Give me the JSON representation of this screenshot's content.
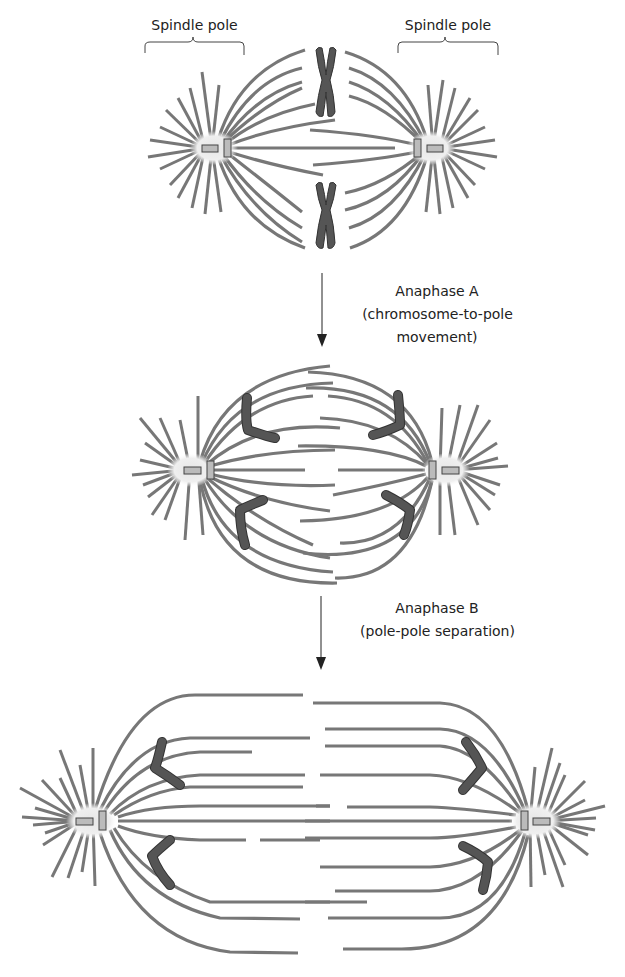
{
  "labels": {
    "spindle_pole_left": "Spindle pole",
    "spindle_pole_right": "Spindle pole",
    "anaphase_a_title": "Anaphase A",
    "anaphase_a_line1": "(chromosome-to-pole",
    "anaphase_a_line2": "movement)",
    "anaphase_b_title": "Anaphase B",
    "anaphase_b_line1": "(pole-pole separation)"
  },
  "stages": [
    {
      "name": "metaphase",
      "left_pole_x": 213,
      "right_pole_x": 432,
      "pole_y": 148
    },
    {
      "name": "anaphase-a",
      "left_pole_x": 190,
      "right_pole_x": 447,
      "pole_y": 470
    },
    {
      "name": "anaphase-b",
      "left_pole_x": 85,
      "right_pole_x": 537,
      "pole_y": 821
    }
  ],
  "colors": {
    "microtubule": "#777777",
    "chromosome": "#555555",
    "centrosome_halo": "#eeeeee",
    "centriole": "#bbbbbb",
    "text": "#222222"
  }
}
